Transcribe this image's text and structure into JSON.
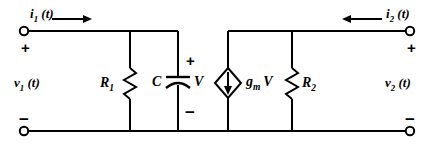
{
  "diagram": {
    "line_color": "#000000",
    "background": "#ffffff"
  },
  "ports": {
    "left": {
      "current_symbol": "i",
      "current_subscript": "1",
      "current_arg": "(t)",
      "current_direction": "right",
      "voltage_symbol": "v",
      "voltage_subscript": "1",
      "voltage_arg": "(t)",
      "top_polarity": "+",
      "bottom_polarity": "−"
    },
    "right": {
      "current_symbol": "i",
      "current_subscript": "2",
      "current_arg": "(t)",
      "current_direction": "left",
      "voltage_symbol": "v",
      "voltage_subscript": "2",
      "voltage_arg": "(t)",
      "top_polarity": "+",
      "bottom_polarity": "−"
    }
  },
  "components": [
    {
      "id": "r1",
      "type": "resistor",
      "symbol": "R",
      "subscript": "1",
      "label_side": "left"
    },
    {
      "id": "c",
      "type": "capacitor",
      "symbol": "C",
      "subscript": "",
      "label_side": "left",
      "node_voltage": "V",
      "top_polarity": "+",
      "bottom_polarity": "−"
    },
    {
      "id": "gmv",
      "type": "dependent-current-source",
      "symbol": "g",
      "subscript": "m",
      "suffix": "V",
      "arrow_direction": "down",
      "label_side": "right"
    },
    {
      "id": "r2",
      "type": "resistor",
      "symbol": "R",
      "subscript": "2",
      "label_side": "right"
    }
  ]
}
